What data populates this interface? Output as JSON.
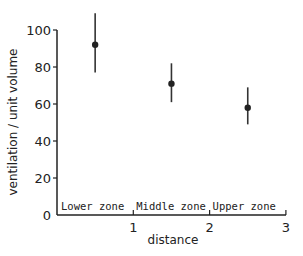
{
  "chart_data": {
    "type": "scatter",
    "title": "",
    "xlabel": "distance",
    "ylabel": "ventilation / unit volume",
    "xlim": [
      0,
      3
    ],
    "ylim": [
      0,
      100
    ],
    "x_ticks": [
      "1",
      "2",
      "3"
    ],
    "y_ticks": [
      "0",
      "20",
      "40",
      "60",
      "80",
      "100"
    ],
    "grid": false,
    "legend": null,
    "zones": [
      "Lower zone",
      "Middle zone",
      "Upper zone"
    ],
    "series": [
      {
        "name": "ventilation",
        "x": [
          0.5,
          1.5,
          2.5
        ],
        "y": [
          92,
          71,
          58
        ],
        "error_low": [
          77,
          61,
          49
        ],
        "error_high": [
          109,
          82,
          69
        ]
      }
    ]
  }
}
